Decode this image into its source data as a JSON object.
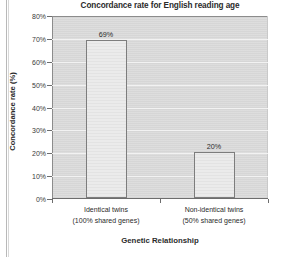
{
  "chart_data": {
    "type": "bar",
    "title": "Concordance rate for English reading age",
    "xlabel": "Genetic Relationship",
    "ylabel": "Concordance rate (%)",
    "categories": [
      {
        "line1": "Identical twins",
        "line2": "(100% shared genes)"
      },
      {
        "line1": "Non-identical twins",
        "line2": "(50% shared genes)"
      }
    ],
    "values": [
      69,
      20
    ],
    "value_labels": [
      "69%",
      "20%"
    ],
    "ylim": [
      0,
      80
    ],
    "ytick_values": [
      0,
      10,
      20,
      30,
      40,
      50,
      60,
      70,
      80
    ],
    "ytick_labels": [
      "0%",
      "10%",
      "20%",
      "30%",
      "40%",
      "50%",
      "60%",
      "70%",
      "80%"
    ],
    "grid": true,
    "legend": null,
    "colors": {
      "plot_background": "#d9d9d9",
      "bar_fill": "#ebebeb",
      "bar_border": "#7d7d7d",
      "gridline": "#f2f2f2",
      "axis": "#6d6d6d",
      "text": "#2b2b2b",
      "page_background": "#ffffff"
    }
  }
}
